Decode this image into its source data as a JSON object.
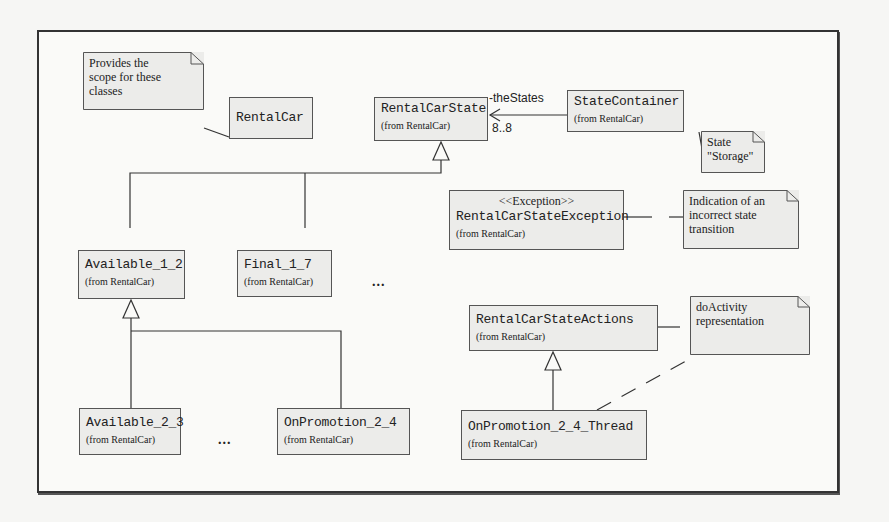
{
  "diagram": {
    "type": "UML class diagram",
    "notes": [
      {
        "id": "scope",
        "text": "Provides the\nscope for these\nclasses"
      },
      {
        "id": "storage",
        "text": "State\n\"Storage\""
      },
      {
        "id": "exception",
        "text": "Indication of an\nincorrect state\ntransition"
      },
      {
        "id": "doactivity",
        "text": "doActivity\nrepresentation"
      }
    ],
    "classes": [
      {
        "id": "rentalcar",
        "name": "RentalCar",
        "from": ""
      },
      {
        "id": "rentalcarstate",
        "name": "RentalCarState",
        "from": "(from RentalCar)"
      },
      {
        "id": "statecontainer",
        "name": "StateContainer",
        "from": "(from RentalCar)"
      },
      {
        "id": "exception",
        "stereotype": "<<Exception>>",
        "name": "RentalCarStateException",
        "from": "(from RentalCar)"
      },
      {
        "id": "available12",
        "name": "Available_1_2",
        "from": "(from RentalCar)"
      },
      {
        "id": "final17",
        "name": "Final_1_7",
        "from": "(from RentalCar)"
      },
      {
        "id": "actions",
        "name": "RentalCarStateActions",
        "from": "(from RentalCar)"
      },
      {
        "id": "available23",
        "name": "Available_2_3",
        "from": "(from RentalCar)"
      },
      {
        "id": "onpromotion24",
        "name": "OnPromotion_2_4",
        "from": "(from RentalCar)"
      },
      {
        "id": "thread",
        "name": "OnPromotion_2_4_Thread",
        "from": "(from RentalCar)"
      }
    ],
    "association": {
      "role": "-theStates",
      "multiplicity": "8..8"
    },
    "ellipsis": "..."
  }
}
